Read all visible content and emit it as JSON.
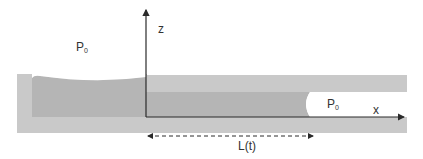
{
  "diagram": {
    "colors": {
      "background": "#ffffff",
      "wall": "#c9c9c9",
      "liquid": "#b5b5b5",
      "axis": "#2a2a2a",
      "text": "#333333"
    },
    "labels": {
      "reservoir_pressure": {
        "main": "P",
        "sub": "0"
      },
      "gas_pressure": {
        "main": "P",
        "sub": "0"
      },
      "z_axis": "z",
      "x_axis": "x",
      "length": "L(t)"
    },
    "elements": {
      "axes": [
        "z",
        "x"
      ],
      "dimension_arrow": "L(t)",
      "regions": [
        "reservoir",
        "channel-walls",
        "liquid-column",
        "gas-meniscus"
      ]
    }
  }
}
